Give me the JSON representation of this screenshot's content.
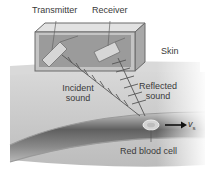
{
  "labels": {
    "transmitter": "Transmitter",
    "receiver": "Receiver",
    "skin": "Skin",
    "incident_1": "Incident",
    "incident_2": "sound",
    "reflected_1": "Reflected",
    "reflected_2": "sound",
    "red_blood_cell": "Red blood cell",
    "velocity": "v",
    "velocity_sub": "s"
  },
  "colors": {
    "tissue": "#bdbdbd",
    "vessel_dark": "#6e6e6e",
    "box": "#8a8a8a",
    "text": "#3a3a3a"
  }
}
